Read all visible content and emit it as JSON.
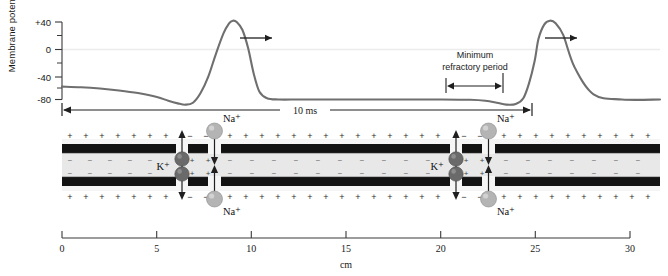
{
  "figure": {
    "background": "#ffffff"
  },
  "chart_data": {
    "type": "line",
    "title": "",
    "xlabel": "cm",
    "ylabel": "Membrane potential (mV)",
    "ylim": [
      -90,
      50
    ],
    "yticks_major": [
      "+40",
      "0",
      "-40",
      "-80"
    ],
    "yticks_major_values": [
      40,
      0,
      -40,
      -80
    ],
    "yticks_minor_values": [
      20,
      -20,
      -60
    ],
    "xlim": [
      0,
      31.5
    ],
    "xticks": [
      "0",
      "5",
      "10",
      "15",
      "20",
      "25",
      "30"
    ],
    "xtick_values": [
      0,
      5,
      10,
      15,
      20,
      25,
      30
    ],
    "grid": false,
    "legend": null,
    "series": [
      {
        "name": "Membrane potential",
        "color": "#6f6f6f",
        "x": [
          0.0,
          1.0,
          2.0,
          3.0,
          4.0,
          5.0,
          5.6,
          6.1,
          6.5,
          6.9,
          7.3,
          7.7,
          8.1,
          8.5,
          8.8,
          9.0,
          9.2,
          9.5,
          9.8,
          10.1,
          10.4,
          10.8,
          11.4,
          12.5,
          14.0,
          16.0,
          18.0,
          20.0,
          21.5,
          22.3,
          22.9,
          23.4,
          23.9,
          24.3,
          24.6,
          24.9,
          25.1,
          25.4,
          25.7,
          26.0,
          26.4,
          27.0,
          28.0,
          29.5,
          31.5
        ],
        "y": [
          -60,
          -61,
          -63,
          -66,
          -70,
          -76,
          -82,
          -86,
          -88,
          -85,
          -70,
          -45,
          -10,
          22,
          38,
          42,
          40,
          28,
          0,
          -40,
          -68,
          -78,
          -80,
          -80,
          -80,
          -80,
          -80,
          -80,
          -80.5,
          -82,
          -85,
          -88,
          -87,
          -78,
          -55,
          -20,
          14,
          36,
          42,
          38,
          20,
          -30,
          -72,
          -80,
          -80
        ]
      }
    ],
    "annotations": [
      {
        "name": "zero-line",
        "type": "hline",
        "value": 0,
        "color": "#e8e8e8"
      },
      {
        "name": "minimum-refractory-period",
        "type": "label-arrow",
        "text_line1": "Minimum",
        "text_line2": "refractory period",
        "x_start": 21.0,
        "x_end": 23.9
      },
      {
        "name": "ten-ms-span",
        "type": "double-arrow",
        "label": "10 ms",
        "x_start": 0.0,
        "x_end": 25.3
      },
      {
        "name": "propagation-arrow-left",
        "type": "arrow-right",
        "x": 10.5
      },
      {
        "name": "propagation-arrow-right",
        "type": "arrow-right",
        "x": 26.5
      }
    ]
  },
  "axon": {
    "label_k": "K⁺",
    "label_na_top": "Na⁺",
    "label_na_bottom": "Na⁺",
    "charge_positive": "+",
    "charge_negative": "−",
    "colors": {
      "membrane_band": "#121212",
      "cytoplasm": "#e8e8e8",
      "channel_gap": "#f5f5f5",
      "na_ion": "#b0b0b0",
      "k_ion": "#6a6a6a",
      "curve": "#6f6f6f"
    },
    "nodes": [
      {
        "name": "node-left",
        "k_channel_cm": 8.35,
        "na_channel_cm": 9.85
      },
      {
        "name": "node-right",
        "k_channel_cm": 23.65,
        "na_channel_cm": 25.15
      }
    ]
  },
  "scale": {
    "unit_label": "cm"
  }
}
